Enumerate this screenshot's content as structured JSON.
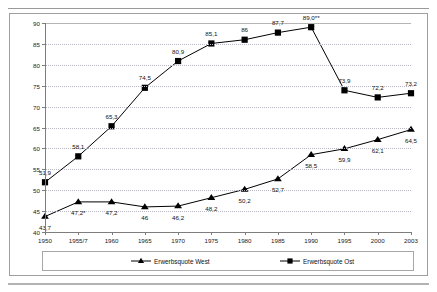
{
  "chart_data": {
    "type": "line",
    "title": "",
    "subtitle": "",
    "xlabel": "",
    "ylabel": "",
    "ylim": [
      40,
      90
    ],
    "yticks": [
      40,
      45,
      50,
      55,
      60,
      65,
      70,
      75,
      80,
      85,
      90
    ],
    "grid": true,
    "legend_position": "bottom",
    "categories": [
      "1950",
      "1955/7",
      "1960",
      "1965",
      "1970",
      "1975",
      "1980",
      "1985",
      "1990",
      "1995",
      "2000",
      "2003"
    ],
    "series": [
      {
        "name": "Erwerbsquote West",
        "marker": "triangle",
        "color": "#000000",
        "values": [
          43.7,
          47.2,
          47.2,
          46.0,
          46.2,
          48.2,
          50.2,
          52.7,
          58.5,
          59.9,
          62.1,
          64.5
        ],
        "labels": [
          "43,7",
          "47,2*",
          "47,2",
          "46",
          "46,2",
          "48,2",
          "50,2",
          "52,7",
          "58,5",
          "59,9",
          "62,1",
          "64,5"
        ],
        "label_positions": [
          "below",
          "below",
          "below",
          "below",
          "below",
          "below",
          "below",
          "below",
          "below",
          "below",
          "below",
          "below"
        ]
      },
      {
        "name": "Erwerbsquote Ost",
        "marker": "square",
        "color": "#000000",
        "values": [
          51.9,
          58.1,
          65.3,
          74.5,
          80.9,
          85.1,
          86.0,
          87.7,
          89.0,
          73.9,
          72.2,
          73.2
        ],
        "labels": [
          "51,9",
          "58,1",
          "65,3",
          "74,5",
          "80,9",
          "85,1",
          "86",
          "87,7",
          "89,0**",
          "73,9",
          "72,2",
          "73,2"
        ],
        "label_positions": [
          "above",
          "above",
          "above",
          "above",
          "above",
          "above",
          "above",
          "above",
          "above",
          "above",
          "above",
          "above"
        ]
      }
    ],
    "annotations": {
      "asterisk_single": "*",
      "asterisk_double": "**"
    }
  },
  "legend": {
    "entries": [
      {
        "label": "Erwerbsquote West",
        "marker": "triangle"
      },
      {
        "label": "Erwerbsquote Ost",
        "marker": "square"
      }
    ]
  },
  "axis": {
    "y_labels": [
      "90",
      "85",
      "80",
      "75",
      "70",
      "65",
      "60",
      "55",
      "50",
      "45",
      "40"
    ],
    "x_labels": [
      "1950",
      "1955/7",
      "1960",
      "1965",
      "1970",
      "1975",
      "1980",
      "1985",
      "1990",
      "1995",
      "2000",
      "2003"
    ]
  }
}
